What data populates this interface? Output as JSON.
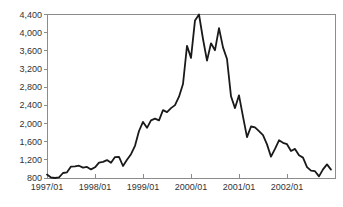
{
  "chart_data": {
    "type": "line",
    "title": "",
    "xlabel": "",
    "ylabel": "",
    "x_start_label": "1997/01",
    "points_per_year": 12,
    "x_tick_labels": [
      "1997/01",
      "1998/01",
      "1999/01",
      "2000/01",
      "2001/01",
      "2002/01"
    ],
    "y_tick_labels": [
      "800",
      "1,200",
      "1,600",
      "2,000",
      "2,400",
      "2,800",
      "3,200",
      "3,600",
      "4,000",
      "4,400"
    ],
    "ylim": [
      800,
      4400
    ],
    "ytick_step": 400,
    "grid": false,
    "legend": "none",
    "series": [
      {
        "name": "index-monthly-close",
        "values": [
          875,
          810,
          800,
          815,
          910,
          925,
          1050,
          1055,
          1070,
          1030,
          1045,
          990,
          1035,
          1140,
          1155,
          1195,
          1135,
          1260,
          1265,
          1065,
          1200,
          1325,
          1510,
          1835,
          2035,
          1905,
          2070,
          2105,
          2070,
          2295,
          2250,
          2340,
          2405,
          2590,
          2870,
          3710,
          3445,
          4270,
          4400,
          3860,
          3385,
          3765,
          3615,
          4100,
          3675,
          3420,
          2600,
          2340,
          2620,
          2150,
          1700,
          1935,
          1915,
          1830,
          1745,
          1540,
          1270,
          1440,
          1630,
          1575,
          1545,
          1395,
          1440,
          1300,
          1250,
          1040,
          960,
          950,
          835,
          990,
          1100,
          985
        ]
      }
    ],
    "colors": {
      "line": "#1a1a1a",
      "frame": "#8c8c8c",
      "tick": "#8c8c8c",
      "label": "#333333",
      "background": "#ffffff"
    }
  }
}
